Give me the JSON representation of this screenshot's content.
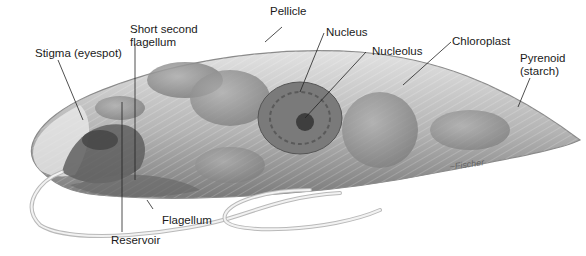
{
  "figure": {
    "labels": {
      "pellicle": "Pellicle",
      "short_second_flagellum": "Short second\nflagellum",
      "stigma": "Stigma (eyespot)",
      "nucleus": "Nucleus",
      "nucleolus": "Nucleolus",
      "chloroplast": "Chloroplast",
      "pyrenoid": "Pyrenoid\n(starch)",
      "flagellum": "Flagellum",
      "reservoir": "Reservoir"
    },
    "signature": "Fischer",
    "colors": {
      "background": "#ffffff",
      "body_light": "#d9d9d9",
      "body_mid": "#a8a8a8",
      "body_dark": "#6e6e6e",
      "organelle": "#8c8c8c",
      "leader_line": "#222222"
    }
  }
}
